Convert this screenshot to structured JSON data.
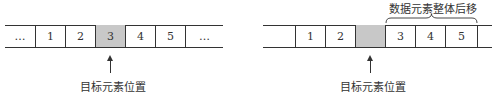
{
  "left_array": {
    "cells": [
      {
        "label": "…",
        "kind": "ellipsis"
      },
      {
        "label": "1",
        "kind": "value"
      },
      {
        "label": "2",
        "kind": "value"
      },
      {
        "label": "3",
        "kind": "target"
      },
      {
        "label": "4",
        "kind": "value"
      },
      {
        "label": "5",
        "kind": "value"
      },
      {
        "label": "…",
        "kind": "ellipsis"
      }
    ],
    "pointer_label": "目标元素位置"
  },
  "right_array": {
    "cells": [
      {
        "label": "",
        "kind": "empty"
      },
      {
        "label": "1",
        "kind": "value"
      },
      {
        "label": "2",
        "kind": "value"
      },
      {
        "label": "",
        "kind": "target"
      },
      {
        "label": "3",
        "kind": "value"
      },
      {
        "label": "4",
        "kind": "value"
      },
      {
        "label": "5",
        "kind": "value"
      }
    ],
    "pointer_label": "目标元素位置",
    "brace_label": "数据元素整体后移"
  },
  "colors": {
    "line": "#333333",
    "target_fill": "#c8c8c8",
    "background": "#ffffff"
  }
}
